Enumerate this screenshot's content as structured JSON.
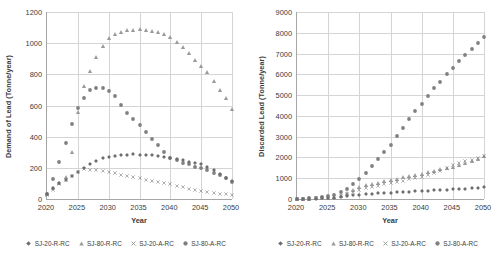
{
  "figure": {
    "marker_color_dark": "#6e6e6e",
    "marker_color_mid": "#808080",
    "marker_color_light": "#9a9a9a",
    "grid_color": "#d4d4d4",
    "axis_color": "#a6a6a6"
  },
  "legend": {
    "items": [
      {
        "label": "SJ-20-R-RC",
        "marker": "diamond-marker"
      },
      {
        "label": "SJ-80-R-RC",
        "marker": "triangle-marker"
      },
      {
        "label": "SJ-20-A-RC",
        "marker": "cross-marker"
      },
      {
        "label": "SJ-80-A-RC",
        "marker": "circle-marker"
      }
    ]
  },
  "chart_data": [
    {
      "type": "scatter",
      "title": "",
      "xlabel": "Year",
      "ylabel": "Demand of Lead  (Tonne/year)",
      "xlim": [
        2020,
        2050
      ],
      "ylim": [
        0,
        1200
      ],
      "xticks": [
        2020,
        2025,
        2030,
        2035,
        2040,
        2045,
        2050
      ],
      "yticks": [
        0,
        200,
        400,
        600,
        800,
        1000,
        1200
      ],
      "grid": true,
      "legend_position": "bottom",
      "x": [
        2020,
        2021,
        2022,
        2023,
        2024,
        2025,
        2026,
        2027,
        2028,
        2029,
        2030,
        2031,
        2032,
        2033,
        2034,
        2035,
        2036,
        2037,
        2038,
        2039,
        2040,
        2041,
        2042,
        2043,
        2044,
        2045,
        2046,
        2047,
        2048,
        2049,
        2050
      ],
      "series": [
        {
          "name": "SJ-20-R-RC",
          "marker": "diamond",
          "values": [
            30,
            70,
            100,
            125,
            150,
            175,
            200,
            225,
            245,
            262,
            272,
            278,
            282,
            285,
            286,
            285,
            283,
            280,
            276,
            270,
            263,
            255,
            248,
            240,
            232,
            222,
            205,
            185,
            160,
            135,
            115
          ]
        },
        {
          "name": "SJ-80-R-RC",
          "marker": "triangle",
          "values": [
            30,
            70,
            105,
            140,
            300,
            560,
            725,
            822,
            912,
            980,
            1030,
            1058,
            1072,
            1082,
            1086,
            1088,
            1086,
            1080,
            1072,
            1058,
            1040,
            1010,
            975,
            935,
            890,
            855,
            812,
            755,
            700,
            645,
            575
          ]
        },
        {
          "name": "SJ-20-A-RC",
          "marker": "cross",
          "values": [
            28,
            60,
            95,
            122,
            148,
            172,
            190,
            188,
            184,
            180,
            172,
            165,
            155,
            148,
            140,
            132,
            125,
            118,
            110,
            102,
            95,
            85,
            75,
            66,
            58,
            52,
            46,
            40,
            35,
            30,
            25
          ]
        },
        {
          "name": "SJ-80-A-RC",
          "marker": "circle",
          "values": [
            30,
            128,
            240,
            360,
            480,
            582,
            650,
            700,
            715,
            715,
            692,
            658,
            605,
            552,
            512,
            478,
            432,
            388,
            345,
            300,
            265,
            248,
            230,
            222,
            208,
            200,
            185,
            168,
            152,
            132,
            112
          ]
        }
      ]
    },
    {
      "type": "scatter",
      "title": "",
      "xlabel": "Year",
      "ylabel": "Discarded  Lead  (Tonne/year)",
      "xlim": [
        2020,
        2050
      ],
      "ylim": [
        0,
        9000
      ],
      "xticks": [
        2020,
        2025,
        2030,
        2035,
        2040,
        2045,
        2050
      ],
      "yticks": [
        0,
        1000,
        2000,
        3000,
        4000,
        5000,
        6000,
        7000,
        8000,
        9000
      ],
      "grid": true,
      "legend_position": "bottom",
      "x": [
        2020,
        2021,
        2022,
        2023,
        2024,
        2025,
        2026,
        2027,
        2028,
        2029,
        2030,
        2031,
        2032,
        2033,
        2034,
        2035,
        2036,
        2037,
        2038,
        2039,
        2040,
        2041,
        2042,
        2043,
        2044,
        2045,
        2046,
        2047,
        2048,
        2049,
        2050
      ],
      "series": [
        {
          "name": "SJ-20-R-RC",
          "marker": "diamond",
          "values": [
            5,
            10,
            16,
            24,
            34,
            48,
            70,
            100,
            140,
            175,
            205,
            230,
            250,
            268,
            285,
            300,
            318,
            335,
            350,
            365,
            382,
            398,
            415,
            432,
            450,
            468,
            485,
            505,
            525,
            545,
            565
          ]
        },
        {
          "name": "SJ-80-R-RC",
          "marker": "triangle",
          "values": [
            5,
            12,
            20,
            32,
            48,
            70,
            110,
            180,
            300,
            430,
            560,
            650,
            720,
            790,
            855,
            920,
            980,
            1040,
            1100,
            1160,
            1225,
            1290,
            1355,
            1420,
            1490,
            1560,
            1640,
            1730,
            1830,
            1940,
            2060
          ]
        },
        {
          "name": "SJ-20-A-RC",
          "marker": "cross",
          "values": [
            4,
            10,
            18,
            28,
            42,
            62,
            95,
            150,
            240,
            350,
            455,
            520,
            580,
            640,
            700,
            760,
            820,
            880,
            945,
            1010,
            1080,
            1160,
            1250,
            1360,
            1480,
            1620,
            1750,
            1830,
            1900,
            1980,
            2090
          ]
        },
        {
          "name": "SJ-80-A-RC",
          "marker": "circle",
          "values": [
            8,
            18,
            32,
            55,
            90,
            140,
            215,
            330,
            500,
            740,
            985,
            1250,
            1580,
            1930,
            2270,
            2620,
            3010,
            3410,
            3830,
            4230,
            4570,
            4980,
            5320,
            5650,
            6000,
            6320,
            6620,
            6930,
            7220,
            7500,
            7780
          ]
        }
      ]
    }
  ]
}
